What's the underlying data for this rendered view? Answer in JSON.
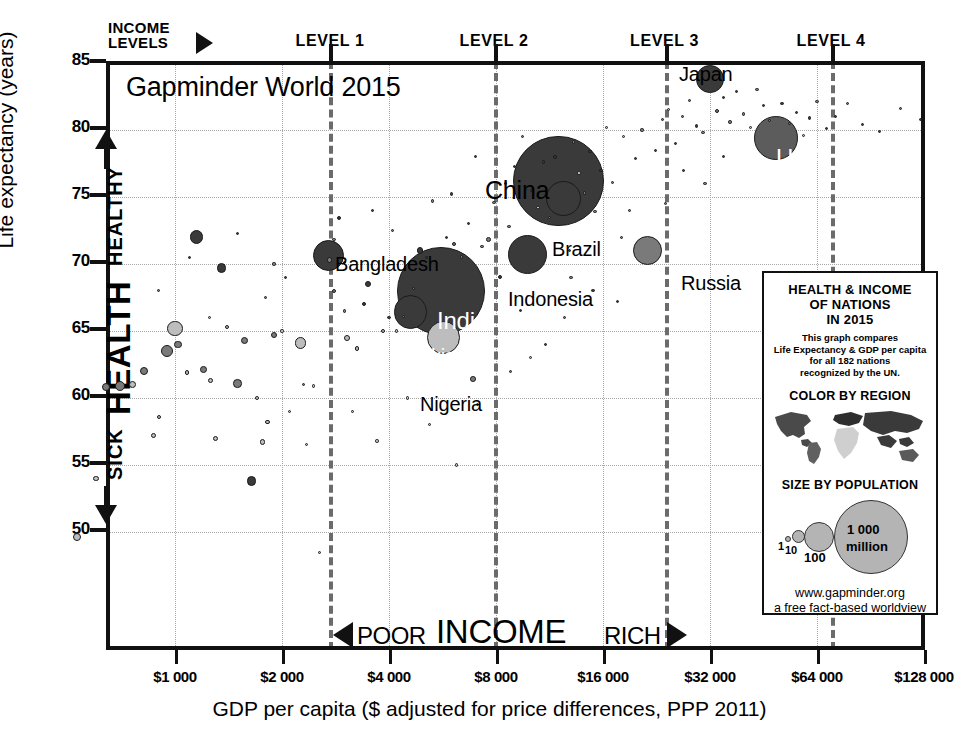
{
  "chart_data": {
    "type": "scatter",
    "title": "Gapminder World 2015",
    "xlabel": "GDP per capita ($ adjusted for price differences, PPP 2011)",
    "ylabel": "Life expectancy (years)",
    "x_scale": "log2",
    "xlim": [
      500,
      160000
    ],
    "ylim": [
      47.5,
      85
    ],
    "grid": true,
    "xticks": [
      {
        "value": 1000,
        "label": "$1 000"
      },
      {
        "value": 2000,
        "label": "$2 000"
      },
      {
        "value": 4000,
        "label": "$4 000"
      },
      {
        "value": 8000,
        "label": "$8 000"
      },
      {
        "value": 16000,
        "label": "$16 000"
      },
      {
        "value": 32000,
        "label": "$32 000"
      },
      {
        "value": 64000,
        "label": "$64 000"
      },
      {
        "value": 128000,
        "label": "$128 000"
      }
    ],
    "yticks": [
      {
        "value": 85,
        "label": "85"
      },
      {
        "value": 80,
        "label": "80"
      },
      {
        "value": 75,
        "label": "75"
      },
      {
        "value": 70,
        "label": "70"
      },
      {
        "value": 65,
        "label": "65"
      },
      {
        "value": 60,
        "label": "60"
      },
      {
        "value": 55,
        "label": "55"
      },
      {
        "value": 50,
        "label": "50"
      }
    ],
    "income_levels": {
      "caption": "INCOME LEVELS",
      "bands": [
        {
          "label": "LEVEL 1",
          "min": 500,
          "max": 2600
        },
        {
          "label": "LEVEL 2",
          "min": 2600,
          "max": 7400
        },
        {
          "label": "LEVEL 3",
          "min": 7400,
          "max": 22000
        },
        {
          "label": "LEVEL 4",
          "min": 22000,
          "max": 160000
        }
      ],
      "boundaries": [
        2600,
        7400,
        22000,
        55000
      ]
    },
    "axis_annotations": {
      "y_high": "HEALTHY",
      "y_mid": "HEALTH",
      "y_low": "SICK",
      "x_low": "POOR",
      "x_mid": "INCOME",
      "x_high": "RICH"
    },
    "labeled_points": [
      {
        "name": "Bangladesh",
        "gdp": 3100,
        "life": 72.0,
        "pop_millions": 161
      },
      {
        "name": "India",
        "gdp": 5900,
        "life": 68.0,
        "pop_millions": 1311
      },
      {
        "name": "Pakistan",
        "gdp": 4700,
        "life": 66.4,
        "pop_millions": 189
      },
      {
        "name": "Nigeria",
        "gdp": 5700,
        "life": 64.5,
        "pop_millions": 182
      },
      {
        "name": "Indonesia",
        "gdp": 10300,
        "life": 70.7,
        "pop_millions": 258
      },
      {
        "name": "China",
        "gdp": 13400,
        "life": 76.2,
        "pop_millions": 1376
      },
      {
        "name": "Brazil",
        "gdp": 14400,
        "life": 74.9,
        "pop_millions": 208
      },
      {
        "name": "Russia",
        "gdp": 23000,
        "life": 71.0,
        "pop_millions": 143
      },
      {
        "name": "Japan",
        "gdp": 37000,
        "life": 83.8,
        "pop_millions": 127
      },
      {
        "name": "USA",
        "gdp": 53000,
        "life": 79.4,
        "pop_millions": 322
      }
    ],
    "legend": {
      "title_lines": [
        "HEALTH & INCOME",
        "OF NATIONS",
        "IN 2015"
      ],
      "description_lines": [
        "This graph compares",
        "Life Expectancy & GDP per capita",
        "for all 182 nations",
        "recognized by the UN."
      ],
      "color_heading": "COLOR BY REGION",
      "size_heading": "SIZE BY POPULATION",
      "size_scale": [
        {
          "label": "1",
          "value": 1
        },
        {
          "label": "10",
          "value": 10
        },
        {
          "label": "100",
          "value": 100
        },
        {
          "label": "1 000\nmillion",
          "value": 1000
        }
      ],
      "size_big_label_line1": "1 000",
      "size_big_label_line2": "million",
      "footer_lines": [
        "www.gapminder.org",
        "a free fact-based worldview"
      ]
    },
    "colors": {
      "dark": "#3a3a3a",
      "mid": "#7d7d7d",
      "light": "#bdbdbd",
      "axis": "#111111",
      "grid": "#a8a8a8",
      "divider": "#6b6b6b"
    }
  }
}
